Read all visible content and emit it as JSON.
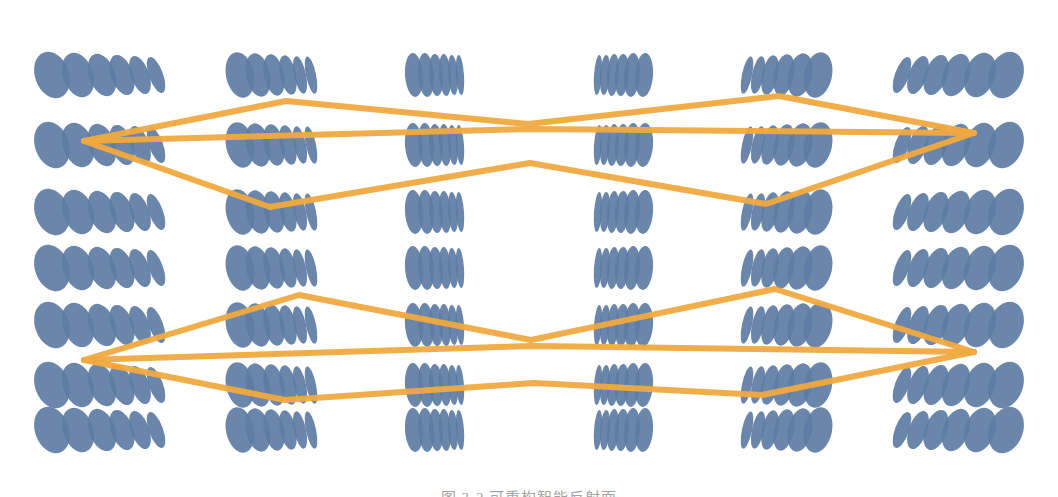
{
  "page": {
    "width": 1058,
    "height": 497,
    "background_color": "#ffffff",
    "top_cropped_text": "有变频的 IRS 与下行波束成",
    "bottom_cropped_caption": "图 3-2  可重构智能反射面"
  },
  "figure": {
    "element_color": "#5d7ca4",
    "element_color_light": "#6f8cb0",
    "beam_color": "#f0a93f",
    "beam_color_dark": "#e79c2c",
    "beam_stroke_width": 6,
    "rows": 7,
    "clusters": 6,
    "columns_per_cluster": 6,
    "total_elements": 252,
    "row_centers_y": [
      75,
      145,
      212,
      268,
      325,
      385,
      430
    ],
    "cluster_labels": [
      "surface-panel-1",
      "surface-panel-2",
      "surface-panel-3",
      "surface-panel-4",
      "surface-panel-5",
      "surface-panel-6"
    ],
    "focus_points": [
      {
        "name": "left-upper-focus",
        "x": 84,
        "y": 141
      },
      {
        "name": "left-lower-focus",
        "x": 84,
        "y": 360
      },
      {
        "name": "right-upper-focus",
        "x": 974,
        "y": 133
      },
      {
        "name": "right-lower-focus",
        "x": 974,
        "y": 352
      }
    ],
    "beam_vertices": [
      {
        "name": "upper-left-peak",
        "x": 286,
        "y": 101
      },
      {
        "name": "upper-left-trough",
        "x": 270,
        "y": 207
      },
      {
        "name": "upper-center-peak",
        "x": 528,
        "y": 124
      },
      {
        "name": "upper-center-trough",
        "x": 530,
        "y": 163
      },
      {
        "name": "upper-right-peak",
        "x": 779,
        "y": 96
      },
      {
        "name": "upper-right-trough",
        "x": 766,
        "y": 204
      },
      {
        "name": "lower-left-peak",
        "x": 299,
        "y": 295
      },
      {
        "name": "lower-left-trough",
        "x": 285,
        "y": 400
      },
      {
        "name": "lower-center-peak",
        "x": 531,
        "y": 340
      },
      {
        "name": "lower-center-trough",
        "x": 534,
        "y": 383
      },
      {
        "name": "lower-right-peak",
        "x": 775,
        "y": 289
      },
      {
        "name": "lower-right-trough",
        "x": 762,
        "y": 395
      }
    ]
  },
  "chart_data": {
    "type": "diagram",
    "panels": [
      {
        "id": 1,
        "center_x": 104,
        "columns": 6,
        "column_x": [
          52,
          78,
          102,
          122,
          140,
          156
        ],
        "element_rx": [
          17,
          15,
          13,
          11,
          9,
          7
        ],
        "element_ry": [
          24,
          23,
          22,
          21,
          20,
          19
        ],
        "tilt_deg": -20
      },
      {
        "id": 2,
        "center_x": 272,
        "columns": 6,
        "column_x": [
          240,
          258,
          274,
          288,
          300,
          311
        ],
        "element_rx": [
          14,
          12,
          10,
          8,
          6,
          5
        ],
        "element_ry": [
          23,
          22,
          21,
          20,
          19,
          19
        ],
        "tilt_deg": -12
      },
      {
        "id": 3,
        "center_x": 437,
        "columns": 6,
        "column_x": [
          414,
          426,
          436,
          445,
          453,
          460
        ],
        "element_rx": [
          9,
          8,
          7,
          6,
          5,
          4
        ],
        "element_ry": [
          22,
          22,
          21,
          21,
          20,
          20
        ],
        "tilt_deg": -4
      },
      {
        "id": 4,
        "center_x": 621,
        "columns": 6,
        "column_x": [
          598,
          605,
          613,
          622,
          632,
          644
        ],
        "element_rx": [
          4,
          5,
          6,
          7,
          8,
          9
        ],
        "element_ry": [
          20,
          20,
          21,
          21,
          22,
          22
        ],
        "tilt_deg": 4
      },
      {
        "id": 5,
        "center_x": 786,
        "columns": 6,
        "column_x": [
          747,
          758,
          770,
          784,
          800,
          818
        ],
        "element_rx": [
          5,
          6,
          8,
          10,
          12,
          14
        ],
        "element_ry": [
          19,
          19,
          20,
          21,
          22,
          23
        ],
        "tilt_deg": 12
      },
      {
        "id": 6,
        "center_x": 954,
        "columns": 6,
        "column_x": [
          902,
          918,
          936,
          956,
          980,
          1006
        ],
        "element_rx": [
          7,
          9,
          11,
          13,
          15,
          17
        ],
        "element_ry": [
          19,
          20,
          21,
          22,
          23,
          24
        ],
        "tilt_deg": 20
      }
    ],
    "rows_y": [
      75,
      145,
      212,
      268,
      325,
      385,
      430
    ],
    "beams": [
      {
        "name": "upper-beam-top-arc",
        "points": "84,141 286,101 528,124 779,96 974,133"
      },
      {
        "name": "upper-beam-mid-chord",
        "points": "84,141 528,129 974,133"
      },
      {
        "name": "upper-beam-bottom-arc",
        "points": "84,141 270,207 530,163 766,204 974,133"
      },
      {
        "name": "lower-beam-top-arc",
        "points": "84,360 299,295 531,340 775,289 974,352"
      },
      {
        "name": "lower-beam-mid-chord",
        "points": "84,360 531,346 974,352"
      },
      {
        "name": "lower-beam-bottom-arc",
        "points": "84,360 285,400 534,383 762,395 974,352"
      }
    ],
    "legend": [],
    "grid": false,
    "xlabel": "",
    "ylabel": ""
  }
}
